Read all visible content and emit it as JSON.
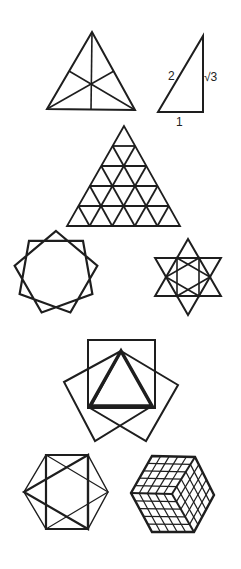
{
  "labels": {
    "hypotenuse": "2",
    "vertical_leg": "√3",
    "base_leg": "1"
  },
  "colors": {
    "stroke": "#1e1e1e",
    "background": "#ffffff"
  },
  "figures": [
    "triangle-with-medians",
    "right-triangle-30-60-90",
    "subdivided-triangle",
    "nine-pointed-star",
    "hexagram-with-inner-star",
    "squares-and-triangle",
    "hexagon-with-triangles",
    "isometric-cube-grid"
  ]
}
